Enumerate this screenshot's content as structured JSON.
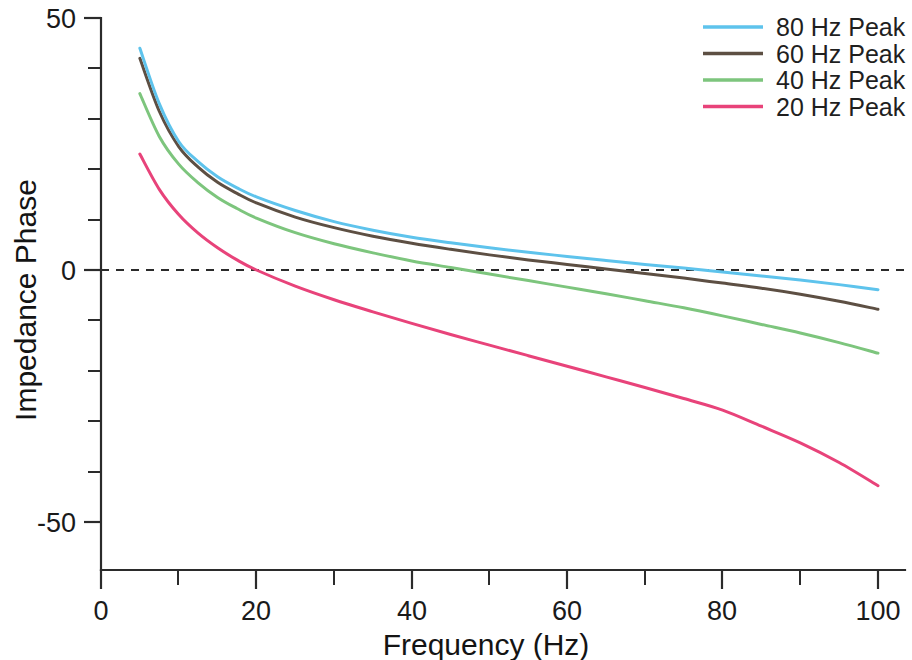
{
  "figure": {
    "background": "#ffffff",
    "axis_color": "#2b2b2b"
  },
  "chart_data": {
    "type": "line",
    "title": "",
    "xlabel": "Frequency (Hz)",
    "ylabel": "Impedance Phase",
    "xlim": [
      0,
      100
    ],
    "ylim": [
      -59,
      50
    ],
    "grid": false,
    "legend_position": "top-right",
    "zero_reference_line": {
      "y": 0,
      "style": "dashed",
      "color": "#2b2b2b"
    },
    "x_ticks_major": [
      0,
      20,
      40,
      60,
      80,
      100
    ],
    "x_tick_labels": [
      "0",
      "20",
      "40",
      "60",
      "80",
      "100"
    ],
    "x_ticks_minor": [
      10,
      30,
      50,
      70,
      90
    ],
    "y_ticks_major": [
      50,
      0,
      -50
    ],
    "y_tick_labels": [
      "50",
      "0",
      "-50"
    ],
    "y_ticks_minor": [
      40,
      30,
      20,
      10,
      -10,
      -20,
      -30,
      -40
    ],
    "x": [
      5,
      7.5,
      10,
      12.5,
      15,
      17.5,
      20,
      25,
      30,
      35,
      40,
      45,
      50,
      55,
      60,
      65,
      70,
      75,
      80,
      85,
      90,
      95,
      100
    ],
    "series": [
      {
        "name": "80 Hz Peak",
        "color": "#5ec3ec",
        "values": [
          44.0,
          33.0,
          25.5,
          21.5,
          18.5,
          16.3,
          14.5,
          11.8,
          9.6,
          7.9,
          6.5,
          5.4,
          4.4,
          3.5,
          2.7,
          1.9,
          1.1,
          0.4,
          -0.4,
          -1.2,
          -2.0,
          -2.9,
          -3.9
        ]
      },
      {
        "name": "60 Hz Peak",
        "color": "#5d4f43",
        "values": [
          42.0,
          31.5,
          24.5,
          20.4,
          17.4,
          15.2,
          13.3,
          10.5,
          8.4,
          6.7,
          5.3,
          4.1,
          3.0,
          2.0,
          1.1,
          0.2,
          -0.7,
          -1.6,
          -2.6,
          -3.6,
          -4.8,
          -6.2,
          -7.8
        ]
      },
      {
        "name": "40 Hz Peak",
        "color": "#7dc57d",
        "values": [
          35.0,
          26.5,
          21.0,
          17.3,
          14.4,
          12.2,
          10.3,
          7.4,
          5.2,
          3.4,
          1.8,
          0.5,
          -0.8,
          -2.1,
          -3.4,
          -4.7,
          -6.1,
          -7.5,
          -9.1,
          -10.8,
          -12.5,
          -14.4,
          -16.5
        ]
      },
      {
        "name": "20 Hz Peak",
        "color": "#e8437a",
        "values": [
          23.0,
          16.0,
          11.0,
          7.3,
          4.4,
          2.0,
          0.0,
          -3.2,
          -5.9,
          -8.3,
          -10.6,
          -12.8,
          -14.9,
          -17.0,
          -19.1,
          -21.2,
          -23.3,
          -25.5,
          -27.8,
          -31.0,
          -34.3,
          -38.2,
          -42.8
        ]
      }
    ]
  },
  "legend": {
    "entries": [
      {
        "label": "80 Hz Peak",
        "color": "#5ec3ec"
      },
      {
        "label": "60 Hz Peak",
        "color": "#5d4f43"
      },
      {
        "label": "40 Hz Peak",
        "color": "#7dc57d"
      },
      {
        "label": "20 Hz Peak",
        "color": "#e8437a"
      }
    ]
  }
}
